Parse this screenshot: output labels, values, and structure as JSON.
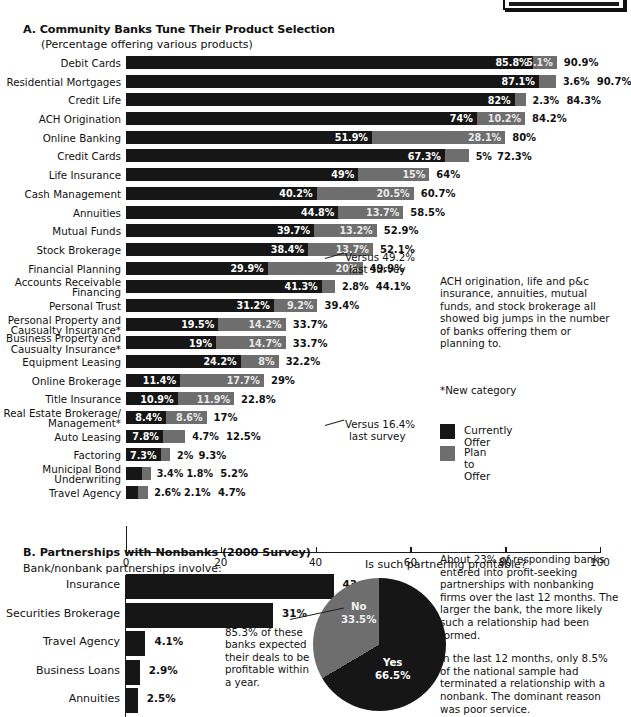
{
  "top_clipped_box": {
    "label": ""
  },
  "section_a": {
    "title": "A. Community Banks Tune Their Product Selection",
    "subtitle": "(Percentage offering various products)",
    "annotation_life_insurance": "Versus 49.2%\nlast survey",
    "annotation_life_insurance_l1": "Versus 49.2%",
    "annotation_life_insurance_l2": "last survey",
    "annotation_equipment_leasing_l1": "Versus 16.4%",
    "annotation_equipment_leasing_l2": "last survey",
    "blurb": "ACH origination, life and p&c insurance, annuities, mutual funds, and stock brokerage all showed big jumps in the number of banks offering them or planning to.",
    "footnote": "*New category",
    "legend": [
      {
        "label": "Currently Offer",
        "color": "#161616"
      },
      {
        "label": "Plan to Offer",
        "color": "#6e6e6e"
      }
    ]
  },
  "section_b": {
    "title": "B. Partnerships with Nonbanks (2000 Survey)",
    "subtitle": "Bank/nonbank partnerships involve:",
    "pie_question": "Is such partnering profitable?",
    "pie_note": "85.3% of these banks expected their deals to be profitable within a year.",
    "blurb_p1": "About 23% of responding banks entered into profit-seeking partnerships with nonbanking firms over the last 12 months. The larger the bank, the more likely such a relationship had been formed.",
    "blurb_p2": "In the last 12 months, only 8.5% of the national sample had terminated a relationship with a nonbank. The dominant reason was poor service."
  },
  "chart_data": [
    {
      "type": "bar",
      "id": "community-banks-products",
      "orientation": "horizontal",
      "stacked": true,
      "title": "A. Community Banks Tune Their Product Selection",
      "subtitle": "(Percentage offering various products)",
      "xlabel": "",
      "ylabel": "",
      "xlim": [
        0,
        100
      ],
      "xticks": [
        0,
        20,
        40,
        60,
        80,
        100
      ],
      "grid": false,
      "legend_position": "right",
      "legend": [
        "Currently Offer",
        "Plan to Offer"
      ],
      "categories": [
        "Debit Cards",
        "Residential Mortgages",
        "Credit Life",
        "ACH Origination",
        "Online Banking",
        "Credit Cards",
        "Life Insurance",
        "Cash Management",
        "Annuities",
        "Mutual Funds",
        "Stock Brokerage",
        "Financial Planning",
        "Accounts Receivable Financing",
        "Personal Trust",
        "Personal Property and Causualty Insurance*",
        "Business Property and Causualty Insurance*",
        "Equipment Leasing",
        "Online Brokerage",
        "Title Insurance",
        "Real Estate Brokerage/ Management*",
        "Auto Leasing",
        "Factoring",
        "Municipal Bond Underwriting",
        "Travel Agency"
      ],
      "series": [
        {
          "name": "Currently Offer",
          "color": "#161616",
          "values": [
            85.8,
            87.1,
            82,
            74,
            51.9,
            67.3,
            49,
            40.2,
            44.8,
            39.7,
            38.4,
            29.9,
            41.3,
            31.2,
            19.5,
            19,
            24.2,
            11.4,
            10.9,
            8.4,
            7.8,
            7.3,
            3.4,
            2.6
          ],
          "labels": [
            "85.8%",
            "87.1%",
            "82%",
            "74%",
            "51.9%",
            "67.3%",
            "49%",
            "40.2%",
            "44.8%",
            "39.7%",
            "38.4%",
            "29.9%",
            "41.3%",
            "31.2%",
            "19.5%",
            "19%",
            "24.2%",
            "11.4%",
            "10.9%",
            "8.4%",
            "7.8%",
            "7.3%",
            "3.4%",
            "2.6%"
          ]
        },
        {
          "name": "Plan to Offer",
          "color": "#6e6e6e",
          "values": [
            5.1,
            3.6,
            2.3,
            10.2,
            28.1,
            5,
            15,
            20.5,
            13.7,
            13.2,
            13.7,
            20,
            2.8,
            9.2,
            14.2,
            14.7,
            8,
            17.7,
            11.9,
            8.6,
            4.7,
            2,
            1.8,
            2.1
          ],
          "labels": [
            "5.1%",
            "3.6%",
            "2.3%",
            "10.2%",
            "28.1%",
            "5%",
            "15%",
            "20.5%",
            "13.7%",
            "13.2%",
            "13.7%",
            "20%",
            "2.8%",
            "9.2%",
            "14.2%",
            "14.7%",
            "8%",
            "17.7%",
            "11.9%",
            "8.6%",
            "4.7%",
            "2%",
            "1.8%",
            "2.1%"
          ]
        }
      ],
      "totals": [
        90.9,
        90.7,
        84.3,
        84.2,
        80,
        72.3,
        64,
        60.7,
        58.5,
        52.9,
        52.1,
        49.9,
        44.1,
        39.4,
        33.7,
        33.7,
        32.2,
        29,
        22.8,
        17,
        12.5,
        9.3,
        5.2,
        4.7
      ],
      "total_labels": [
        "90.9%",
        "90.7%",
        "84.3%",
        "84.2%",
        "80%",
        "72.3%",
        "64%",
        "60.7%",
        "58.5%",
        "52.9%",
        "52.1%",
        "49.9%",
        "44.1%",
        "39.4%",
        "33.7%",
        "33.7%",
        "32.2%",
        "29%",
        "22.8%",
        "17%",
        "12.5%",
        "9.3%",
        "5.2%",
        "4.7%"
      ],
      "annotations": [
        {
          "category": "Life Insurance",
          "text": "Versus 49.2% last survey"
        },
        {
          "category": "Equipment Leasing",
          "text": "Versus 16.4% last survey"
        }
      ]
    },
    {
      "type": "bar",
      "id": "bank-nonbank-partnerships",
      "orientation": "horizontal",
      "title": "B. Partnerships with Nonbanks (2000 Survey)",
      "subtitle": "Bank/nonbank partnerships involve:",
      "xlim": [
        0,
        50
      ],
      "grid": false,
      "categories": [
        "Insurance",
        "Securities Brokerage",
        "Travel Agency",
        "Business Loans",
        "Annuities"
      ],
      "values": [
        43.8,
        31,
        4.1,
        2.9,
        2.5
      ],
      "labels": [
        "43.8%",
        "31%",
        "4.1%",
        "2.9%",
        "2.5%"
      ],
      "color": "#161616"
    },
    {
      "type": "pie",
      "id": "is-partnering-profitable",
      "title": "Is such partnering profitable?",
      "labels": [
        "Yes",
        "No"
      ],
      "values": [
        66.5,
        33.5
      ],
      "value_labels": [
        "66.5%",
        "33.5%"
      ],
      "colors": [
        "#161616",
        "#6e6e6e"
      ],
      "start_angle_deg": 0,
      "direction": "clockwise",
      "annotation": "85.3% of these banks expected their deals to be profitable within a year."
    }
  ],
  "axis_a": {
    "ticks": [
      {
        "value": 0,
        "label": "0"
      },
      {
        "value": 20,
        "label": "20"
      },
      {
        "value": 40,
        "label": "40"
      },
      {
        "value": 60,
        "label": "60"
      },
      {
        "value": 80,
        "label": "80"
      },
      {
        "value": 100,
        "label": "100"
      }
    ]
  }
}
